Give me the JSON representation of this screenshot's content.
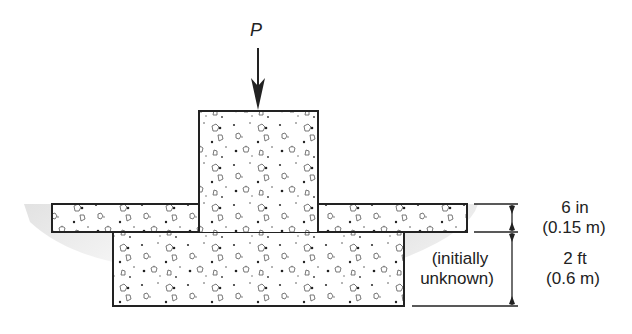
{
  "diagram": {
    "type": "structural footing cross-section",
    "load": {
      "label": "P",
      "direction": "downward"
    },
    "components": {
      "column": {
        "name": "concrete column"
      },
      "slab": {
        "name": "slab on grade"
      },
      "footing": {
        "name": "footing"
      }
    },
    "dimensions": {
      "slab_thickness": {
        "imperial": "6 in",
        "metric": "(0.15 m)"
      },
      "footing_depth": {
        "imperial": "2 ft",
        "metric": "(0.6 m)",
        "note_line1": "(initially",
        "note_line2": "unknown)"
      }
    },
    "colors": {
      "outline": "#222222",
      "fill": "#ffffff",
      "soil_shadow": "#d8d8d8",
      "aggregate": "#333333"
    }
  }
}
